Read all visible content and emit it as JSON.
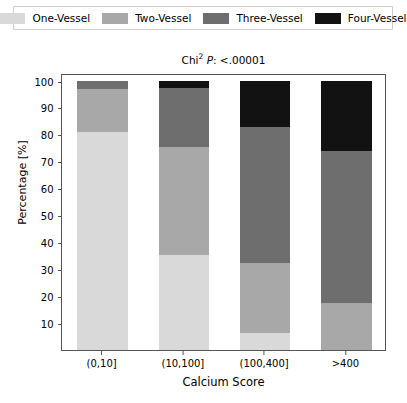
{
  "figure": {
    "title_prefix": "Chi",
    "title_sup": "2",
    "title_italic": "P",
    "title_suffix": ": <.00001",
    "background": "#ffffff"
  },
  "legend": {
    "position": "above-axes",
    "entries": [
      {
        "label": "One-Vessel",
        "color": "#d9d9d9"
      },
      {
        "label": "Two-Vessel",
        "color": "#a8a8a8"
      },
      {
        "label": "Three-Vessel",
        "color": "#6e6e6e"
      },
      {
        "label": "Four-Vessel",
        "color": "#121212"
      }
    ]
  },
  "axis": {
    "ylabel": "Percentage [%]",
    "xlabel": "Calcium Score",
    "yticks": [
      10,
      20,
      30,
      40,
      50,
      60,
      70,
      80,
      90,
      100
    ],
    "ytick_labels": [
      "10",
      "20",
      "30",
      "40",
      "50",
      "60",
      "70",
      "80",
      "90",
      "100"
    ],
    "ylim": [
      0,
      103
    ],
    "xtick_labels": [
      "(0,10]",
      "(10,100]",
      "(100,400]",
      ">400"
    ]
  },
  "chart_data": {
    "type": "bar",
    "stacked": true,
    "xlabel": "Calcium Score",
    "ylabel": "Percentage [%]",
    "ylim": [
      0,
      103
    ],
    "grid": false,
    "legend_position": "top",
    "categories": [
      "(0,10]",
      "(10,100]",
      "(100,400]",
      ">400"
    ],
    "series": [
      {
        "name": "One-Vessel",
        "color": "#d9d9d9",
        "values": [
          81.0,
          35.5,
          6.5,
          0.0
        ]
      },
      {
        "name": "Two-Vessel",
        "color": "#a8a8a8",
        "values": [
          16.0,
          40.0,
          26.0,
          17.5
        ]
      },
      {
        "name": "Three-Vessel",
        "color": "#6e6e6e",
        "values": [
          3.0,
          22.0,
          50.5,
          56.5
        ]
      },
      {
        "name": "Four-Vessel",
        "color": "#121212",
        "values": [
          0.0,
          2.5,
          17.0,
          26.0
        ]
      }
    ],
    "annotations": [
      "Chi² P: <.00001"
    ]
  }
}
